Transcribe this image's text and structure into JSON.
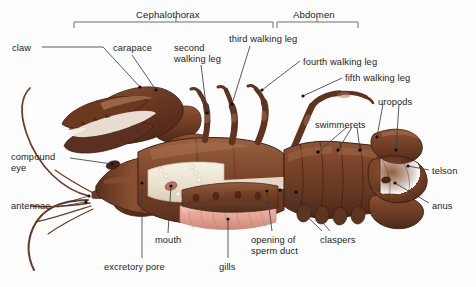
{
  "figure": {
    "background_color": "#fdfdfd",
    "label_color": "#1c1c1c",
    "leader_line_color": "#3d3d3d"
  },
  "palette": {
    "shell_dark": "#5a2f1d",
    "shell_mid": "#7b4429",
    "shell_light": "#9a6243",
    "shell_highlight": "#c08a66",
    "gill_pink": "#e3a596",
    "gill_pink_light": "#f0c2b4",
    "membrane_cream": "#e9e0cd",
    "membrane_white": "#f6f1e4",
    "antenna_brown": "#6b3a24",
    "outline": "#4a2516"
  },
  "brackets": [
    {
      "id": "cephalothorax",
      "label": "Cephalothorax",
      "x1": 74,
      "x2": 273,
      "tick": 176,
      "y": 28,
      "label_x": 136,
      "label_y": 10
    },
    {
      "id": "abdomen",
      "label": "Abdomen",
      "x1": 277,
      "x2": 358,
      "tick": 317,
      "y": 28,
      "label_x": 293,
      "label_y": 10
    }
  ],
  "labels": [
    {
      "id": "claw",
      "text": "claw",
      "x": 12,
      "y": 43,
      "align": "left"
    },
    {
      "id": "carapace",
      "text": "carapace",
      "x": 113,
      "y": 43,
      "align": "left"
    },
    {
      "id": "second-walking-leg",
      "text": "second\nwalking leg",
      "x": 174,
      "y": 43,
      "align": "left"
    },
    {
      "id": "third-walking-leg",
      "text": "third walking leg",
      "x": 229,
      "y": 34,
      "align": "left"
    },
    {
      "id": "fourth-walking-leg",
      "text": "fourth walking leg",
      "x": 303,
      "y": 57,
      "align": "left"
    },
    {
      "id": "fifth-walking-leg",
      "text": "fifth walking leg",
      "x": 345,
      "y": 73,
      "align": "left"
    },
    {
      "id": "uropods",
      "text": "uropods",
      "x": 378,
      "y": 97,
      "align": "left"
    },
    {
      "id": "swimmerets",
      "text": "swimmerets",
      "x": 315,
      "y": 120,
      "align": "left"
    },
    {
      "id": "telson",
      "text": "telson",
      "x": 432,
      "y": 166,
      "align": "left"
    },
    {
      "id": "anus",
      "text": "anus",
      "x": 432,
      "y": 201,
      "align": "left"
    },
    {
      "id": "compound-eye",
      "text": "compound\neye",
      "x": 11,
      "y": 152,
      "align": "left"
    },
    {
      "id": "antennae",
      "text": "antennae",
      "x": 11,
      "y": 201,
      "align": "left"
    },
    {
      "id": "mouth",
      "text": "mouth",
      "x": 155,
      "y": 235,
      "align": "left"
    },
    {
      "id": "excretory-pore",
      "text": "excretory pore",
      "x": 104,
      "y": 262,
      "align": "left"
    },
    {
      "id": "gills",
      "text": "gills",
      "x": 219,
      "y": 262,
      "align": "left"
    },
    {
      "id": "opening-of-sperm-duct",
      "text": "opening of\nsperm duct",
      "x": 251,
      "y": 235,
      "align": "left"
    },
    {
      "id": "claspers",
      "text": "claspers",
      "x": 320,
      "y": 235,
      "align": "left"
    }
  ],
  "leaders": [
    {
      "id": "claw-leader",
      "path": "M 42 47 L 103 47 L 140 87",
      "dot": [
        140,
        87
      ]
    },
    {
      "id": "carapace-leader",
      "path": "M 132 55 L 156 90",
      "dot": [
        156,
        90
      ]
    },
    {
      "id": "second-walking-leg-leader",
      "path": "M 201 65 L 207 113",
      "dot": [
        207,
        113
      ]
    },
    {
      "id": "third-walking-leg-leader",
      "path": "M 250 46 L 232 104",
      "dot": [
        232,
        104
      ]
    },
    {
      "id": "fourth-walking-leg-leader",
      "path": "M 300 61 L 262 90",
      "dot": [
        262,
        90
      ]
    },
    {
      "id": "fifth-walking-leg-leader",
      "path": "M 342 78 L 303 96",
      "dot": [
        303,
        96
      ]
    },
    {
      "id": "uropods-leader-a",
      "path": "M 383 104 L 377 137",
      "dot": [
        377,
        137
      ]
    },
    {
      "id": "uropods-leader-b",
      "path": "M 399 104 L 396 150",
      "dot": [
        396,
        150
      ]
    },
    {
      "id": "swimmerets-leader-a",
      "path": "M 347 127 L 318 152",
      "dot": [
        318,
        152
      ]
    },
    {
      "id": "swimmerets-leader-b",
      "path": "M 352 127 L 338 150",
      "dot": [
        338,
        150
      ]
    },
    {
      "id": "swimmerets-leader-c",
      "path": "M 357 127 L 360 150",
      "dot": [
        360,
        150
      ]
    },
    {
      "id": "telson-leader",
      "path": "M 429 170 L 408 166",
      "dot": [
        408,
        166
      ]
    },
    {
      "id": "anus-leader",
      "path": "M 429 203 L 395 183",
      "dot": [
        395,
        183
      ]
    },
    {
      "id": "compound-eye-leader",
      "path": "M 70 158 L 112 164",
      "dot": [
        112,
        164
      ]
    },
    {
      "id": "antennae-leader-a",
      "path": "M 57 205 L 89 196",
      "dot": [
        89,
        196
      ]
    },
    {
      "id": "antennae-leader-b",
      "path": "M 57 207 L 86 202",
      "dot": [
        86,
        202
      ]
    },
    {
      "id": "mouth-leader",
      "path": "M 168 233 L 171 186",
      "dot": [
        171,
        186
      ]
    },
    {
      "id": "excretory-pore-leader",
      "path": "M 142 258 L 142 183",
      "dot": [
        142,
        183
      ]
    },
    {
      "id": "gills-leader",
      "path": "M 228 258 L 228 219",
      "dot": [
        228,
        219
      ]
    },
    {
      "id": "sperm-duct-leader",
      "path": "M 272 231 L 267 191",
      "dot": [
        267,
        191
      ]
    },
    {
      "id": "claspers-leader-a",
      "path": "M 322 231 L 280 190",
      "dot": [
        280,
        190
      ]
    },
    {
      "id": "claspers-leader-b",
      "path": "M 330 231 L 296 192",
      "dot": [
        296,
        192
      ]
    }
  ]
}
